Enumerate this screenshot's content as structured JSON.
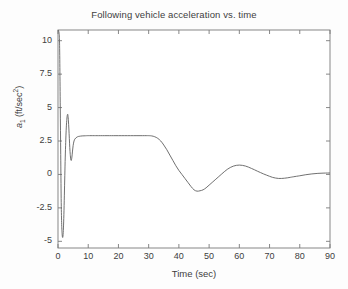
{
  "chart_data": {
    "type": "line",
    "title": "Following vehicle acceleration vs. time",
    "xlabel": "Time (sec)",
    "ylabel": "a_1 (ft/sec^2)",
    "ylabel_parts": {
      "symbol": "a",
      "subscript": "1",
      "units": " (ft/sec",
      "superscript": "2",
      "close": ")"
    },
    "xlim": [
      0,
      90
    ],
    "ylim": [
      -5.5,
      10.8
    ],
    "xticks": [
      0,
      10,
      20,
      30,
      40,
      50,
      60,
      70,
      80,
      90
    ],
    "xticklabels": [
      "0",
      "10",
      "20",
      "30",
      "40",
      "50",
      "60",
      "70",
      "80",
      "90"
    ],
    "yticks": [
      10,
      7.5,
      5,
      2.5,
      0,
      -2.5,
      -5
    ],
    "yticklabels": [
      "10",
      "7.5",
      "5",
      "2.5",
      "0",
      "-2.5",
      "-5"
    ],
    "grid": false,
    "legend": false,
    "line_color": "#606060",
    "line_width": 0.9,
    "series": [
      {
        "name": "a1",
        "x": [
          0.0,
          0.35,
          0.5,
          0.62,
          0.75,
          0.9,
          1.05,
          1.2,
          1.35,
          1.5,
          1.65,
          1.8,
          1.95,
          2.1,
          2.25,
          2.4,
          2.55,
          2.7,
          2.85,
          3.0,
          3.1,
          3.2,
          3.3,
          3.45,
          3.6,
          3.75,
          3.9,
          4.05,
          4.2,
          4.4,
          4.6,
          4.8,
          5.0,
          5.3,
          5.6,
          6.0,
          6.5,
          7.0,
          8.0,
          9.0,
          10.0,
          12.0,
          14.0,
          17.0,
          20.0,
          24.0,
          28.0,
          30.0,
          31.0,
          32.0,
          33.0,
          34.0,
          35.0,
          36.0,
          37.0,
          38.0,
          39.0,
          40.0,
          41.0,
          42.0,
          43.0,
          44.0,
          45.0,
          46.0,
          47.0,
          48.0,
          49.0,
          50.0,
          51.0,
          52.0,
          53.0,
          54.0,
          55.0,
          56.0,
          57.0,
          58.0,
          59.0,
          60.0,
          61.0,
          62.0,
          63.0,
          64.0,
          65.0,
          66.0,
          67.0,
          68.0,
          69.0,
          70.0,
          71.0,
          72.0,
          73.0,
          74.0,
          75.0,
          76.0,
          77.0,
          78.0,
          80.0,
          82.0,
          84.0,
          86.0,
          88.0,
          90.0
        ],
        "y": [
          10.8,
          10.6,
          10.0,
          8.0,
          5.0,
          1.5,
          -1.8,
          -3.6,
          -4.4,
          -4.7,
          -4.6,
          -4.0,
          -3.0,
          -1.6,
          -0.1,
          1.3,
          2.4,
          3.3,
          3.9,
          4.3,
          4.45,
          4.5,
          4.4,
          4.0,
          3.4,
          2.7,
          2.0,
          1.5,
          1.15,
          1.05,
          1.3,
          1.75,
          2.15,
          2.5,
          2.65,
          2.75,
          2.82,
          2.85,
          2.88,
          2.89,
          2.9,
          2.9,
          2.9,
          2.9,
          2.9,
          2.9,
          2.9,
          2.9,
          2.88,
          2.82,
          2.7,
          2.5,
          2.2,
          1.85,
          1.45,
          1.05,
          0.65,
          0.3,
          0.0,
          -0.3,
          -0.6,
          -0.9,
          -1.15,
          -1.25,
          -1.22,
          -1.15,
          -1.0,
          -0.8,
          -0.6,
          -0.4,
          -0.2,
          0.0,
          0.2,
          0.38,
          0.52,
          0.62,
          0.68,
          0.7,
          0.68,
          0.63,
          0.55,
          0.45,
          0.35,
          0.24,
          0.14,
          0.04,
          -0.05,
          -0.14,
          -0.22,
          -0.27,
          -0.3,
          -0.3,
          -0.28,
          -0.25,
          -0.21,
          -0.17,
          -0.1,
          -0.02,
          0.04,
          0.08,
          0.1,
          0.11
        ]
      }
    ]
  },
  "axes": {
    "plot_box": {
      "left": 58,
      "top": 30,
      "right": 330,
      "bottom": 248
    }
  }
}
